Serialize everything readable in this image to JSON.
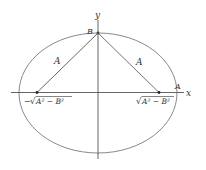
{
  "diagram": {
    "type": "ellipse-foci",
    "colors": {
      "background": "#ffffff",
      "ellipse": "#7a7a7a",
      "axes": "#555555",
      "segments": "#666666",
      "points": "#222222",
      "text": "#333333"
    },
    "axes": {
      "x_label": "x",
      "y_label": "y"
    },
    "vertex_top_label": "B",
    "vertex_right_label": "A",
    "segment_left_label": "A",
    "segment_right_label": "A",
    "focus_left": {
      "label_sign": "−",
      "label_radical": "√",
      "label_radicand": "A² − B²"
    },
    "focus_right": {
      "label_radical": "√",
      "label_radicand": "A² − B²"
    }
  }
}
